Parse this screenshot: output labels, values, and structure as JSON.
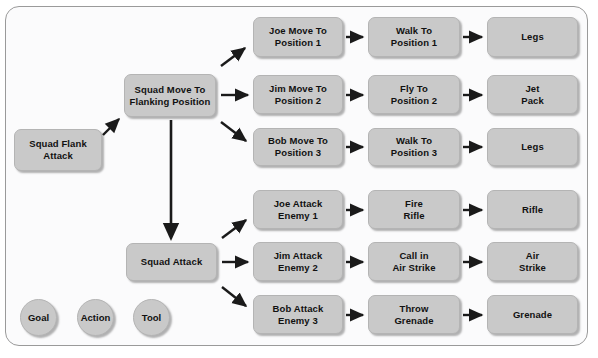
{
  "diagram": {
    "colors": {
      "node_fill": "#c9c9c9",
      "node_border": "#b4b4b4",
      "frame_border": "#9a9a9a",
      "canvas_background": "#fbfbfc",
      "arrow": "#1a1a1a",
      "text": "#111111"
    },
    "nodes": [
      {
        "id": "squad-flank-attack",
        "label": "Squad Flank\nAttack",
        "kind": "goal",
        "x": 14,
        "y": 129,
        "w": 88,
        "h": 42
      },
      {
        "id": "squad-move-to-flanking-position",
        "label": "Squad Move To\nFlanking Position",
        "kind": "goal",
        "x": 124,
        "y": 74,
        "w": 92,
        "h": 43
      },
      {
        "id": "squad-attack",
        "label": "Squad Attack",
        "kind": "goal",
        "x": 126,
        "y": 243,
        "w": 91,
        "h": 38
      },
      {
        "id": "joe-move-to-position-1",
        "label": "Joe Move To\nPosition 1",
        "kind": "goal",
        "x": 253,
        "y": 17,
        "w": 90,
        "h": 40
      },
      {
        "id": "jim-move-to-position-2",
        "label": "Jim Move To\nPosition 2",
        "kind": "goal",
        "x": 253,
        "y": 75,
        "w": 90,
        "h": 39
      },
      {
        "id": "bob-move-to-position-3",
        "label": "Bob Move To\nPosition 3",
        "kind": "goal",
        "x": 253,
        "y": 128,
        "w": 90,
        "h": 38
      },
      {
        "id": "walk-to-position-1",
        "label": "Walk To\nPosition 1",
        "kind": "action",
        "x": 368,
        "y": 17,
        "w": 92,
        "h": 40
      },
      {
        "id": "fly-to-position-2",
        "label": "Fly To\nPosition 2",
        "kind": "action",
        "x": 368,
        "y": 75,
        "w": 92,
        "h": 39
      },
      {
        "id": "walk-to-position-3",
        "label": "Walk To\nPosition 3",
        "kind": "action",
        "x": 368,
        "y": 128,
        "w": 92,
        "h": 38
      },
      {
        "id": "legs-1",
        "label": "Legs",
        "kind": "tool",
        "x": 487,
        "y": 17,
        "w": 91,
        "h": 40
      },
      {
        "id": "jet-pack",
        "label": "Jet\nPack",
        "kind": "tool",
        "x": 487,
        "y": 75,
        "w": 91,
        "h": 39
      },
      {
        "id": "legs-2",
        "label": "Legs",
        "kind": "tool",
        "x": 487,
        "y": 128,
        "w": 91,
        "h": 38
      },
      {
        "id": "joe-attack-enemy-1",
        "label": "Joe Attack\nEnemy 1",
        "kind": "goal",
        "x": 253,
        "y": 190,
        "w": 90,
        "h": 39
      },
      {
        "id": "jim-attack-enemy-2",
        "label": "Jim Attack\nEnemy 2",
        "kind": "goal",
        "x": 253,
        "y": 242,
        "w": 90,
        "h": 39
      },
      {
        "id": "bob-attack-enemy-3",
        "label": "Bob Attack\nEnemy 3",
        "kind": "goal",
        "x": 253,
        "y": 295,
        "w": 90,
        "h": 39
      },
      {
        "id": "fire-rifle",
        "label": "Fire\nRifle",
        "kind": "action",
        "x": 368,
        "y": 190,
        "w": 92,
        "h": 39
      },
      {
        "id": "call-in-air-strike",
        "label": "Call in\nAir Strike",
        "kind": "action",
        "x": 368,
        "y": 242,
        "w": 92,
        "h": 39
      },
      {
        "id": "throw-grenade",
        "label": "Throw\nGrenade",
        "kind": "action",
        "x": 368,
        "y": 295,
        "w": 92,
        "h": 39
      },
      {
        "id": "rifle",
        "label": "Rifle",
        "kind": "tool",
        "x": 487,
        "y": 190,
        "w": 91,
        "h": 39
      },
      {
        "id": "air-strike",
        "label": "Air\nStrike",
        "kind": "tool",
        "x": 487,
        "y": 242,
        "w": 91,
        "h": 39
      },
      {
        "id": "grenade",
        "label": "Grenade",
        "kind": "tool",
        "x": 487,
        "y": 295,
        "w": 91,
        "h": 39
      }
    ],
    "legend": [
      {
        "id": "legend-goal",
        "label": "Goal",
        "x": 20,
        "y": 299
      },
      {
        "id": "legend-action",
        "label": "Action",
        "x": 77,
        "y": 299
      },
      {
        "id": "legend-tool",
        "label": "Tool",
        "x": 133,
        "y": 299
      }
    ],
    "edges": [
      {
        "from": "squad-flank-attack",
        "to": "squad-move-to-flanking-position",
        "style": "diagonal-up"
      },
      {
        "from": "squad-move-to-flanking-position",
        "to": "squad-attack",
        "style": "vertical-down"
      },
      {
        "from": "squad-move-to-flanking-position",
        "to": "joe-move-to-position-1",
        "style": "diagonal-up"
      },
      {
        "from": "squad-move-to-flanking-position",
        "to": "jim-move-to-position-2",
        "style": "horizontal"
      },
      {
        "from": "squad-move-to-flanking-position",
        "to": "bob-move-to-position-3",
        "style": "diagonal-down"
      },
      {
        "from": "squad-attack",
        "to": "joe-attack-enemy-1",
        "style": "diagonal-up"
      },
      {
        "from": "squad-attack",
        "to": "jim-attack-enemy-2",
        "style": "horizontal"
      },
      {
        "from": "squad-attack",
        "to": "bob-attack-enemy-3",
        "style": "diagonal-down"
      },
      {
        "from": "joe-move-to-position-1",
        "to": "walk-to-position-1",
        "style": "horizontal"
      },
      {
        "from": "jim-move-to-position-2",
        "to": "fly-to-position-2",
        "style": "horizontal"
      },
      {
        "from": "bob-move-to-position-3",
        "to": "walk-to-position-3",
        "style": "horizontal"
      },
      {
        "from": "walk-to-position-1",
        "to": "legs-1",
        "style": "horizontal"
      },
      {
        "from": "fly-to-position-2",
        "to": "jet-pack",
        "style": "horizontal"
      },
      {
        "from": "walk-to-position-3",
        "to": "legs-2",
        "style": "horizontal"
      },
      {
        "from": "joe-attack-enemy-1",
        "to": "fire-rifle",
        "style": "horizontal"
      },
      {
        "from": "jim-attack-enemy-2",
        "to": "call-in-air-strike",
        "style": "horizontal"
      },
      {
        "from": "bob-attack-enemy-3",
        "to": "throw-grenade",
        "style": "horizontal"
      },
      {
        "from": "fire-rifle",
        "to": "rifle",
        "style": "horizontal"
      },
      {
        "from": "call-in-air-strike",
        "to": "air-strike",
        "style": "horizontal"
      },
      {
        "from": "throw-grenade",
        "to": "grenade",
        "style": "horizontal"
      }
    ]
  }
}
